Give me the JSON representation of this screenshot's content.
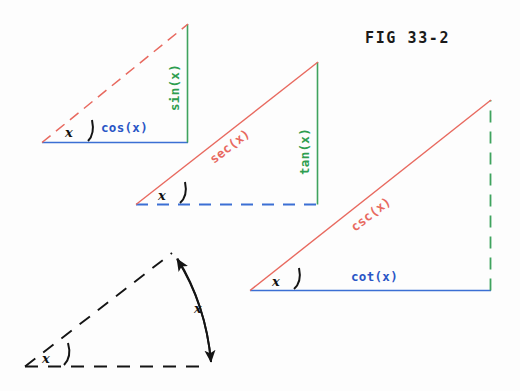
{
  "figure": {
    "caption": "FIG 33-2",
    "background_color": "#fdfdfd",
    "colors": {
      "blue": "#3b6fd4",
      "blue_text": "#2a56c6",
      "green": "#3fa35e",
      "green_text": "#2e9e4f",
      "red": "#e8695f",
      "black": "#141414"
    }
  },
  "angle_symbol": "x",
  "triangles": [
    {
      "name": "sine-cosine-triangle",
      "vertex": {
        "x": 42,
        "y": 142
      },
      "corner": {
        "x": 188,
        "y": 142
      },
      "apex": {
        "x": 188,
        "y": 24
      },
      "sides": [
        {
          "name": "cos-side",
          "label": "cos(x)",
          "color": "#3b6fd4",
          "style": "solid",
          "orientation": "horizontal"
        },
        {
          "name": "sin-side",
          "label": "sin(x)",
          "color": "#3fa35e",
          "style": "solid",
          "orientation": "vertical"
        },
        {
          "name": "hypotenuse-side",
          "label": "",
          "color": "#e8695f",
          "style": "dashed",
          "orientation": "diagonal"
        }
      ],
      "angle_label": "x"
    },
    {
      "name": "secant-tangent-triangle",
      "vertex": {
        "x": 136,
        "y": 204
      },
      "corner": {
        "x": 318,
        "y": 204
      },
      "apex": {
        "x": 318,
        "y": 62
      },
      "sides": [
        {
          "name": "base-side",
          "label": "",
          "color": "#3b6fd4",
          "style": "dashed",
          "orientation": "horizontal"
        },
        {
          "name": "tan-side",
          "label": "tan(x)",
          "color": "#3fa35e",
          "style": "solid",
          "orientation": "vertical"
        },
        {
          "name": "sec-side",
          "label": "sec(x)",
          "color": "#e8695f",
          "style": "solid",
          "orientation": "diagonal"
        }
      ],
      "angle_label": "x"
    },
    {
      "name": "cosecant-cotangent-triangle",
      "vertex": {
        "x": 250,
        "y": 290
      },
      "corner": {
        "x": 491,
        "y": 290
      },
      "apex": {
        "x": 491,
        "y": 100
      },
      "sides": [
        {
          "name": "cot-side",
          "label": "cot(x)",
          "color": "#3b6fd4",
          "style": "solid",
          "orientation": "horizontal"
        },
        {
          "name": "vertical-side",
          "label": "",
          "color": "#3fa35e",
          "style": "dashed",
          "orientation": "vertical"
        },
        {
          "name": "csc-side",
          "label": "csc(x)",
          "color": "#e8695f",
          "style": "solid",
          "orientation": "diagonal"
        }
      ],
      "angle_label": "x"
    }
  ],
  "sector": {
    "name": "angle-sector-figure",
    "vertex": {
      "x": 25,
      "y": 366
    },
    "base_end": {
      "x": 208,
      "y": 366
    },
    "ray_end": {
      "x": 172,
      "y": 253
    },
    "style": "dashed",
    "color": "#141414",
    "arc_label": "x",
    "vertex_angle_label": "x",
    "arrow": "double-headed"
  },
  "labels": {
    "cos": "cos(x)",
    "sin": "sin(x)",
    "sec": "sec(x)",
    "tan": "tan(x)",
    "csc": "csc(x)",
    "cot": "cot(x)",
    "fig": "FIG 33-2"
  }
}
